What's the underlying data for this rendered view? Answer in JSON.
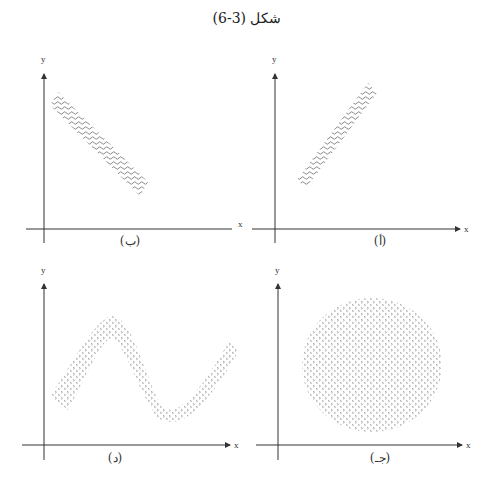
{
  "title": "شكل (3-6)",
  "panels": [
    {
      "id": "b",
      "caption": "(ب)",
      "x_label": "x",
      "y_label": "y",
      "shape": "negative-slope band"
    },
    {
      "id": "a",
      "caption": "(أ)",
      "x_label": "x",
      "y_label": "y",
      "shape": "positive-slope band"
    },
    {
      "id": "d",
      "caption": "(د)",
      "x_label": "x",
      "y_label": "y",
      "shape": "wave band"
    },
    {
      "id": "j",
      "caption": "(جـ)",
      "x_label": "x",
      "y_label": "y",
      "shape": "circle"
    }
  ],
  "colors": {
    "axis": "#333333",
    "pattern": "#555555"
  }
}
